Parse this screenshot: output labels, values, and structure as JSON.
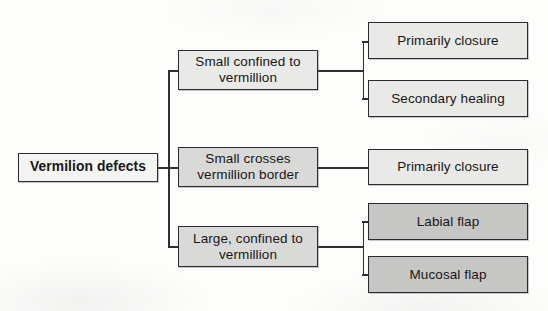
{
  "diagram": {
    "type": "flowchart-tree",
    "orientation": "left-to-right",
    "colors": {
      "border": "#2b2b2b",
      "line": "#2f2f2f",
      "background": "#fdfdfc",
      "fill_lightest": "#f4f4f2",
      "fill_light": "#e9e9e7",
      "fill_mid": "#d9d9d7",
      "fill_dark": "#c6c6c4"
    },
    "root": {
      "label": "Vermilion defects"
    },
    "branches": [
      {
        "label": "Small confined to vermillion",
        "line1": "Small confined to",
        "line2": "vermillion",
        "children": [
          {
            "label": "Primarily closure"
          },
          {
            "label": "Secondary healing"
          }
        ]
      },
      {
        "label": "Small crosses vermillion border",
        "line1": "Small crosses",
        "line2": "vermillion border",
        "children": [
          {
            "label": "Primarily closure"
          }
        ]
      },
      {
        "label": "Large, confined to vermillion",
        "line1": "Large, confined to",
        "line2": "vermillion",
        "children": [
          {
            "label": "Labial flap"
          },
          {
            "label": "Mucosal flap"
          }
        ]
      }
    ]
  }
}
